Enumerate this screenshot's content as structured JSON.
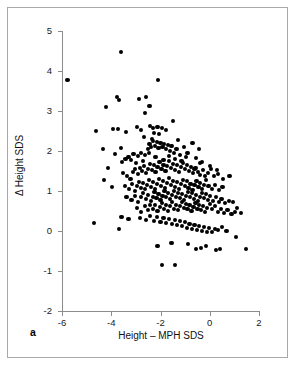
{
  "figure": {
    "panel_label": "a",
    "background_color": "#ffffff",
    "frame_color": "#a9a9a9",
    "point_color": "#000000"
  },
  "chart_data": {
    "type": "scatter",
    "title": "",
    "xlabel": "Height – MPH SDS",
    "ylabel": "Δ Height SDS",
    "xlim": [
      -6,
      2
    ],
    "ylim": [
      -2,
      5
    ],
    "xticks": [
      -6,
      -4,
      -2,
      0,
      2
    ],
    "yticks": [
      -2,
      -1,
      0,
      1,
      2,
      3,
      4,
      5
    ],
    "xticklabels": [
      "-6",
      "-4",
      "-2",
      "0",
      "2"
    ],
    "yticklabels": [
      "-2",
      "-1",
      "0",
      "1",
      "2",
      "3",
      "4",
      "5"
    ],
    "grid": false,
    "legend": null,
    "marker": "filled-circle",
    "n_points": 292,
    "relationship": "negative correlation",
    "points": [
      [
        -5.78,
        3.77
      ],
      [
        -3.62,
        4.47
      ],
      [
        -2.1,
        3.78
      ],
      [
        -4.22,
        3.11
      ],
      [
        -3.77,
        3.35
      ],
      [
        -3.7,
        3.28
      ],
      [
        -2.86,
        3.3
      ],
      [
        -2.6,
        3.35
      ],
      [
        -2.45,
        3.12
      ],
      [
        -2.62,
        2.95
      ],
      [
        -4.63,
        2.5
      ],
      [
        -3.92,
        2.55
      ],
      [
        -3.72,
        2.55
      ],
      [
        -3.4,
        2.48
      ],
      [
        -2.97,
        2.6
      ],
      [
        -2.8,
        2.52
      ],
      [
        -2.42,
        2.62
      ],
      [
        -2.3,
        2.58
      ],
      [
        -2.12,
        2.6
      ],
      [
        -1.95,
        2.57
      ],
      [
        -1.78,
        2.52
      ],
      [
        -1.5,
        2.75
      ],
      [
        -2.25,
        2.45
      ],
      [
        -2.05,
        2.42
      ],
      [
        -4.35,
        2.04
      ],
      [
        -4.12,
        1.57
      ],
      [
        -4.3,
        1.27
      ],
      [
        -3.98,
        1.1
      ],
      [
        -3.55,
        1.72
      ],
      [
        -3.42,
        1.8
      ],
      [
        -3.3,
        1.85
      ],
      [
        -3.2,
        1.78
      ],
      [
        -3.1,
        1.92
      ],
      [
        -3.0,
        1.7
      ],
      [
        -2.9,
        1.88
      ],
      [
        -2.8,
        1.95
      ],
      [
        -2.72,
        1.76
      ],
      [
        -2.62,
        1.9
      ],
      [
        -2.52,
        2.05
      ],
      [
        -2.45,
        2.18
      ],
      [
        -2.38,
        2.1
      ],
      [
        -2.3,
        2.24
      ],
      [
        -2.22,
        2.12
      ],
      [
        -2.15,
        2.22
      ],
      [
        -2.08,
        2.08
      ],
      [
        -2.0,
        2.2
      ],
      [
        -1.92,
        2.1
      ],
      [
        -1.85,
        2.18
      ],
      [
        -1.78,
        2.06
      ],
      [
        -1.7,
        2.14
      ],
      [
        -1.62,
        2.0
      ],
      [
        -1.55,
        2.12
      ],
      [
        -1.45,
        1.95
      ],
      [
        -1.35,
        2.05
      ],
      [
        -1.2,
        1.9
      ],
      [
        -1.05,
        2.1
      ],
      [
        -0.9,
        1.95
      ],
      [
        -0.7,
        2.2
      ],
      [
        -0.55,
        1.82
      ],
      [
        -0.4,
        1.7
      ],
      [
        -3.52,
        1.45
      ],
      [
        -3.35,
        1.38
      ],
      [
        -3.22,
        1.3
      ],
      [
        -3.12,
        1.48
      ],
      [
        -3.02,
        1.55
      ],
      [
        -2.92,
        1.42
      ],
      [
        -2.84,
        1.58
      ],
      [
        -2.76,
        1.5
      ],
      [
        -2.68,
        1.62
      ],
      [
        -2.6,
        1.45
      ],
      [
        -2.52,
        1.56
      ],
      [
        -2.44,
        1.68
      ],
      [
        -2.36,
        1.52
      ],
      [
        -2.28,
        1.64
      ],
      [
        -2.2,
        1.48
      ],
      [
        -2.12,
        1.6
      ],
      [
        -2.04,
        1.72
      ],
      [
        -1.96,
        1.55
      ],
      [
        -1.88,
        1.66
      ],
      [
        -1.8,
        1.5
      ],
      [
        -1.72,
        1.62
      ],
      [
        -1.64,
        1.74
      ],
      [
        -1.56,
        1.58
      ],
      [
        -1.48,
        1.68
      ],
      [
        -1.4,
        1.52
      ],
      [
        -1.32,
        1.64
      ],
      [
        -1.24,
        1.48
      ],
      [
        -1.16,
        1.6
      ],
      [
        -1.08,
        1.7
      ],
      [
        -1.0,
        1.55
      ],
      [
        -0.92,
        1.66
      ],
      [
        -0.84,
        1.5
      ],
      [
        -0.76,
        1.6
      ],
      [
        -0.68,
        1.45
      ],
      [
        -0.58,
        1.58
      ],
      [
        -0.48,
        1.48
      ],
      [
        -0.38,
        1.4
      ],
      [
        -0.28,
        1.52
      ],
      [
        -0.18,
        1.38
      ],
      [
        -0.08,
        1.45
      ],
      [
        0.05,
        1.55
      ],
      [
        0.18,
        1.38
      ],
      [
        0.32,
        1.42
      ],
      [
        0.55,
        1.3
      ],
      [
        0.8,
        1.38
      ],
      [
        -3.45,
        1.12
      ],
      [
        -3.28,
        1.05
      ],
      [
        -3.15,
        1.18
      ],
      [
        -3.05,
        1.0
      ],
      [
        -2.95,
        1.12
      ],
      [
        -2.86,
        1.22
      ],
      [
        -2.78,
        1.08
      ],
      [
        -2.7,
        1.2
      ],
      [
        -2.62,
        1.05
      ],
      [
        -2.54,
        1.16
      ],
      [
        -2.46,
        1.28
      ],
      [
        -2.38,
        1.1
      ],
      [
        -2.3,
        1.22
      ],
      [
        -2.22,
        1.06
      ],
      [
        -2.14,
        1.18
      ],
      [
        -2.06,
        1.3
      ],
      [
        -1.98,
        1.12
      ],
      [
        -1.9,
        1.24
      ],
      [
        -1.82,
        1.08
      ],
      [
        -1.74,
        1.2
      ],
      [
        -1.66,
        1.32
      ],
      [
        -1.58,
        1.14
      ],
      [
        -1.5,
        1.26
      ],
      [
        -1.42,
        1.1
      ],
      [
        -1.34,
        1.22
      ],
      [
        -1.26,
        1.06
      ],
      [
        -1.18,
        1.18
      ],
      [
        -1.1,
        1.28
      ],
      [
        -1.02,
        1.12
      ],
      [
        -0.94,
        1.24
      ],
      [
        -0.86,
        1.08
      ],
      [
        -0.78,
        1.18
      ],
      [
        -0.7,
        1.02
      ],
      [
        -0.62,
        1.14
      ],
      [
        -0.54,
        1.26
      ],
      [
        -0.46,
        1.1
      ],
      [
        -0.38,
        1.2
      ],
      [
        -0.3,
        1.04
      ],
      [
        -0.22,
        1.16
      ],
      [
        -0.14,
        1.28
      ],
      [
        -0.05,
        1.12
      ],
      [
        0.08,
        1.05
      ],
      [
        0.22,
        1.15
      ],
      [
        0.38,
        1.02
      ],
      [
        0.52,
        1.1
      ],
      [
        -3.38,
        0.85
      ],
      [
        -3.18,
        0.78
      ],
      [
        -3.02,
        0.88
      ],
      [
        -2.9,
        0.72
      ],
      [
        -2.8,
        0.84
      ],
      [
        -2.7,
        0.95
      ],
      [
        -2.6,
        0.8
      ],
      [
        -2.5,
        0.9
      ],
      [
        -2.4,
        0.75
      ],
      [
        -2.32,
        0.86
      ],
      [
        -2.24,
        0.98
      ],
      [
        -2.16,
        0.82
      ],
      [
        -2.08,
        0.92
      ],
      [
        -2.0,
        0.78
      ],
      [
        -1.92,
        0.88
      ],
      [
        -1.84,
        1.0
      ],
      [
        -1.76,
        0.84
      ],
      [
        -1.68,
        0.94
      ],
      [
        -1.6,
        0.8
      ],
      [
        -1.52,
        0.9
      ],
      [
        -1.44,
        1.0
      ],
      [
        -1.36,
        0.86
      ],
      [
        -1.28,
        0.96
      ],
      [
        -1.2,
        0.82
      ],
      [
        -1.12,
        0.92
      ],
      [
        -1.04,
        0.78
      ],
      [
        -0.96,
        0.88
      ],
      [
        -0.88,
        0.98
      ],
      [
        -0.8,
        0.84
      ],
      [
        -0.72,
        0.94
      ],
      [
        -0.64,
        0.8
      ],
      [
        -0.56,
        0.9
      ],
      [
        -0.48,
        0.76
      ],
      [
        -0.4,
        0.86
      ],
      [
        -0.32,
        0.96
      ],
      [
        -0.24,
        0.82
      ],
      [
        -0.16,
        0.92
      ],
      [
        -0.08,
        0.78
      ],
      [
        0.02,
        0.88
      ],
      [
        0.12,
        0.74
      ],
      [
        0.24,
        0.84
      ],
      [
        0.36,
        0.72
      ],
      [
        0.48,
        0.8
      ],
      [
        0.62,
        0.7
      ],
      [
        0.78,
        0.74
      ],
      [
        0.95,
        0.72
      ],
      [
        1.12,
        0.58
      ],
      [
        1.28,
        0.45
      ],
      [
        -2.95,
        0.58
      ],
      [
        -2.78,
        0.48
      ],
      [
        -2.64,
        0.62
      ],
      [
        -2.52,
        0.52
      ],
      [
        -2.42,
        0.64
      ],
      [
        -2.32,
        0.55
      ],
      [
        -2.22,
        0.66
      ],
      [
        -2.12,
        0.5
      ],
      [
        -2.02,
        0.6
      ],
      [
        -1.94,
        0.7
      ],
      [
        -1.86,
        0.55
      ],
      [
        -1.78,
        0.65
      ],
      [
        -1.7,
        0.5
      ],
      [
        -1.62,
        0.62
      ],
      [
        -1.54,
        0.72
      ],
      [
        -1.46,
        0.56
      ],
      [
        -1.38,
        0.66
      ],
      [
        -1.3,
        0.52
      ],
      [
        -1.22,
        0.62
      ],
      [
        -1.14,
        0.72
      ],
      [
        -1.06,
        0.58
      ],
      [
        -0.98,
        0.68
      ],
      [
        -0.9,
        0.54
      ],
      [
        -0.82,
        0.64
      ],
      [
        -0.74,
        0.5
      ],
      [
        -0.66,
        0.6
      ],
      [
        -0.58,
        0.7
      ],
      [
        -0.5,
        0.56
      ],
      [
        -0.42,
        0.66
      ],
      [
        -0.34,
        0.52
      ],
      [
        -0.26,
        0.62
      ],
      [
        -0.18,
        0.48
      ],
      [
        -0.1,
        0.58
      ],
      [
        0.0,
        0.68
      ],
      [
        0.1,
        0.54
      ],
      [
        0.2,
        0.62
      ],
      [
        0.32,
        0.48
      ],
      [
        0.45,
        0.56
      ],
      [
        0.58,
        0.46
      ],
      [
        0.72,
        0.52
      ],
      [
        0.88,
        0.42
      ],
      [
        1.02,
        0.48
      ],
      [
        -3.58,
        0.35
      ],
      [
        -3.3,
        0.3
      ],
      [
        -2.82,
        0.32
      ],
      [
        -2.6,
        0.28
      ],
      [
        -2.44,
        0.38
      ],
      [
        -2.28,
        0.25
      ],
      [
        -2.14,
        0.35
      ],
      [
        -2.0,
        0.22
      ],
      [
        -1.88,
        0.32
      ],
      [
        -1.76,
        0.2
      ],
      [
        -1.64,
        0.3
      ],
      [
        -1.52,
        0.18
      ],
      [
        -1.42,
        0.28
      ],
      [
        -1.32,
        0.15
      ],
      [
        -1.22,
        0.25
      ],
      [
        -1.12,
        0.12
      ],
      [
        -1.02,
        0.22
      ],
      [
        -0.92,
        0.08
      ],
      [
        -0.82,
        0.18
      ],
      [
        -0.72,
        0.05
      ],
      [
        -0.62,
        0.15
      ],
      [
        -0.52,
        0.02
      ],
      [
        -0.42,
        0.12
      ],
      [
        -0.32,
        0.0
      ],
      [
        -0.22,
        0.1
      ],
      [
        -0.12,
        -0.02
      ],
      [
        -0.02,
        0.08
      ],
      [
        0.1,
        -0.02
      ],
      [
        0.22,
        0.06
      ],
      [
        0.35,
        0.02
      ],
      [
        0.5,
        0.1
      ],
      [
        0.68,
        0.0
      ],
      [
        -4.7,
        0.2
      ],
      [
        -3.68,
        0.05
      ],
      [
        -2.12,
        -0.38
      ],
      [
        -1.55,
        -0.3
      ],
      [
        -0.88,
        -0.32
      ],
      [
        -0.55,
        -0.45
      ],
      [
        -0.35,
        -0.42
      ],
      [
        -0.15,
        -0.38
      ],
      [
        0.25,
        -0.48
      ],
      [
        0.42,
        -0.45
      ],
      [
        1.08,
        -0.15
      ],
      [
        1.48,
        -0.45
      ],
      [
        -1.95,
        -0.85
      ],
      [
        -1.42,
        -0.84
      ],
      [
        -2.48,
        1.95
      ],
      [
        -2.2,
        1.85
      ],
      [
        -1.88,
        1.78
      ],
      [
        -1.65,
        1.88
      ],
      [
        -1.4,
        1.8
      ],
      [
        -1.15,
        1.75
      ],
      [
        -0.95,
        1.85
      ],
      [
        -0.62,
        1.55
      ],
      [
        -0.3,
        1.72
      ],
      [
        0.02,
        1.62
      ],
      [
        0.28,
        1.52
      ],
      [
        -2.68,
        2.35
      ],
      [
        -2.35,
        2.3
      ],
      [
        -1.28,
        2.28
      ],
      [
        -0.45,
        2.05
      ],
      [
        -3.85,
        1.92
      ],
      [
        -3.62,
        2.08
      ]
    ]
  }
}
